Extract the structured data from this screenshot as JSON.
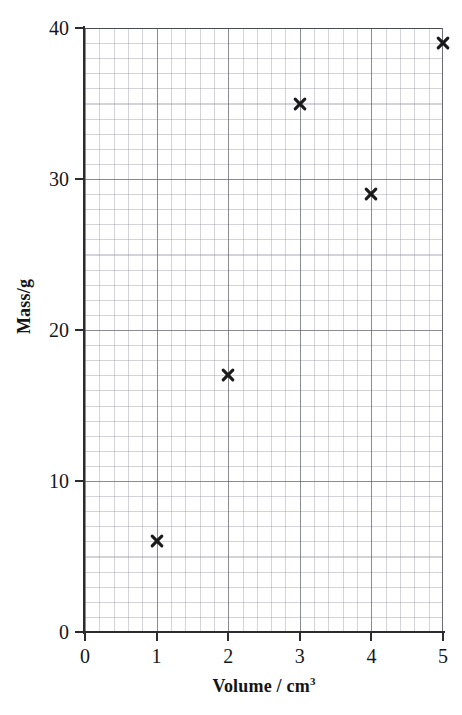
{
  "chart_data": {
    "type": "scatter",
    "title": "",
    "subtitle": "",
    "xlabel": "Volume / cm3",
    "ylabel": "Mass/g",
    "xlim": [
      0,
      5
    ],
    "ylim": [
      0,
      40
    ],
    "grid": true,
    "grid_style": "graph-paper: minor grid 0.2 cm3 by 2 g, major grid 1 cm3 by 10 g",
    "legend": false,
    "legend_position": "none",
    "marker": "cross",
    "marker_color": "#1a1a1a",
    "x": [
      1,
      2,
      3,
      4,
      5
    ],
    "y": [
      6,
      17,
      35,
      29,
      39
    ],
    "points": [
      {
        "x": 1,
        "y": 6
      },
      {
        "x": 2,
        "y": 17
      },
      {
        "x": 3,
        "y": 35
      },
      {
        "x": 4,
        "y": 29
      },
      {
        "x": 5,
        "y": 39
      }
    ],
    "xticks": [
      0,
      1,
      2,
      3,
      4,
      5
    ],
    "yticks": [
      0,
      10,
      20,
      30,
      40
    ],
    "xticklabels": [
      "0",
      "1",
      "2",
      "3",
      "4",
      "5"
    ],
    "yticklabels": [
      "0",
      "10",
      "20",
      "30",
      "40"
    ]
  },
  "axes": {
    "x_title_main": "Volume",
    "x_title_separator": "/",
    "x_title_unit": "cm",
    "x_title_exponent": "3",
    "y_title": "Mass/g"
  },
  "colors": {
    "marker": "#1a1a1a",
    "axis": "#2b2b30",
    "major_grid": "#50505a",
    "minor_grid": "#8c8c9b",
    "background": "#ffffff",
    "text": "#17171a"
  }
}
